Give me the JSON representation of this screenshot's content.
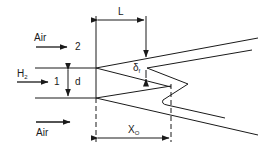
{
  "diagram": {
    "type": "jet flame schematic",
    "labels": {
      "air_top": "Air",
      "stream_2": "2",
      "h2_main": "H",
      "h2_sub": "2",
      "stream_1": "1",
      "diameter": "d",
      "air_bottom": "Air",
      "length": "L",
      "flame_thickness_main": "δ",
      "flame_thickness_sub": "f",
      "liftoff_main": "X",
      "liftoff_sub": "O"
    },
    "colors": {
      "line": "#1a1a1a",
      "background": "#ffffff"
    }
  }
}
